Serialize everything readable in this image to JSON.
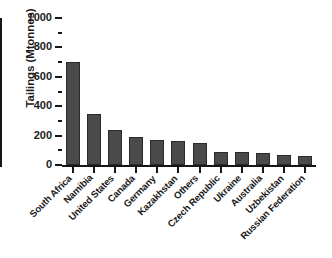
{
  "chart_data": {
    "type": "bar",
    "title": "",
    "xlabel": "",
    "ylabel": "Tailings (Mtonnes)",
    "ylim": [
      0,
      1000
    ],
    "ytick_labels": [
      "0",
      "200",
      "400",
      "600",
      "800",
      "1000"
    ],
    "ytick_values": [
      0,
      200,
      400,
      600,
      800,
      1000
    ],
    "yminor_values": [
      100,
      300,
      500,
      700,
      900
    ],
    "grid": false,
    "legend": null,
    "orientation": "vertical",
    "bar_color": "#4a4a4a",
    "bar_edge_color": "#2b2b2b",
    "axis_color": "#161616",
    "background": "#ffffff",
    "categories": [
      "South Africa",
      "Namibia",
      "United States",
      "Canada",
      "Germany",
      "Kazakhstan",
      "Others",
      "Czech Republic",
      "Ukraine",
      "Australia",
      "Uzbekistan",
      "Russian Federation"
    ],
    "values": [
      700,
      345,
      240,
      190,
      170,
      163,
      150,
      90,
      88,
      82,
      65,
      60
    ]
  }
}
